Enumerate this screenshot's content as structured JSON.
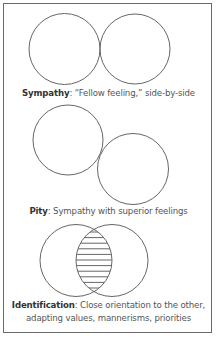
{
  "figure": {
    "panels": [
      {
        "id": "sympathy",
        "term": "Sympathy",
        "separator": ":",
        "description": " “Fellow feeling,” side-by-side",
        "circles": [
          {
            "cx": 64.5,
            "cy": 49,
            "r": 35.5
          },
          {
            "cx": 135,
            "cy": 49,
            "r": 35
          }
        ]
      },
      {
        "id": "pity",
        "term": "Pity",
        "separator": ":",
        "description": " Sympathy with superior feelings",
        "circles": [
          {
            "cx": 68,
            "cy": 140,
            "r": 35
          },
          {
            "cx": 133,
            "cy": 169,
            "r": 35.5
          }
        ]
      },
      {
        "id": "identification",
        "term": "Identification",
        "separator": ":",
        "description_line1": " Close orientation to the other,",
        "description_line2": "adapting values, mannerisms, priorities",
        "circles": [
          {
            "cx": 76,
            "cy": 260.5,
            "r": 36
          },
          {
            "cx": 112,
            "cy": 260.5,
            "r": 36
          }
        ],
        "overlap_fill": "horizontal-hatch"
      }
    ]
  },
  "colors": {
    "stroke": "#666666",
    "border": "#6a6a6a",
    "text": "#555555",
    "term": "#333333"
  }
}
